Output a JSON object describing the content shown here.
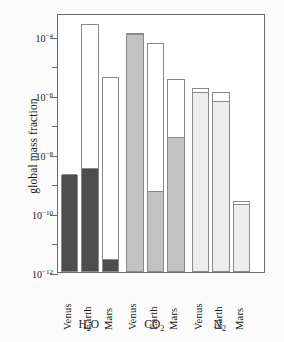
{
  "chart_data": {
    "type": "bar",
    "title": "",
    "xlabel": "",
    "ylabel": "global mass fraction",
    "yscale": "log",
    "ylim": [
      1e-12,
      0.0006
    ],
    "grid": false,
    "legend": false,
    "ytick_labels": [
      "10-4",
      "10-6",
      "10-8",
      "10-10",
      "10-12"
    ],
    "ytick_values": [
      0.0001,
      1e-06,
      1e-08,
      1e-10,
      1e-12
    ],
    "groups": [
      {
        "name": "H2O",
        "label_base": "H",
        "label_sub": "2",
        "label_tail": "O",
        "fill_color": "#4d4d4d",
        "bars": [
          {
            "category": "Venus",
            "total": 2e-09,
            "filled": 2e-09
          },
          {
            "category": "Earth",
            "total": 0.00025,
            "filled": 3e-09
          },
          {
            "category": "Mars",
            "total": 4e-06,
            "filled": 2.5e-12
          }
        ]
      },
      {
        "name": "CO2",
        "label_base": "CO",
        "label_sub": "2",
        "label_tail": "",
        "fill_color": "#c2c2c2",
        "bars": [
          {
            "category": "Venus",
            "total": 0.00013,
            "filled": 0.00011
          },
          {
            "category": "Earth",
            "total": 6e-05,
            "filled": 5e-10
          },
          {
            "category": "Mars",
            "total": 3.5e-06,
            "filled": 3.5e-08
          }
        ]
      },
      {
        "name": "N2",
        "label_base": "N",
        "label_sub": "2",
        "label_tail": "",
        "fill_color": "#ededed",
        "bars": [
          {
            "category": "Venus",
            "total": 1.7e-06,
            "filled": 1.2e-06
          },
          {
            "category": "Earth",
            "total": 1.3e-06,
            "filled": 6e-07
          },
          {
            "category": "Mars",
            "total": 2.6e-10,
            "filled": 1.9e-10
          }
        ]
      }
    ]
  },
  "axis": {
    "ylabel_text": "global mass fraction"
  }
}
